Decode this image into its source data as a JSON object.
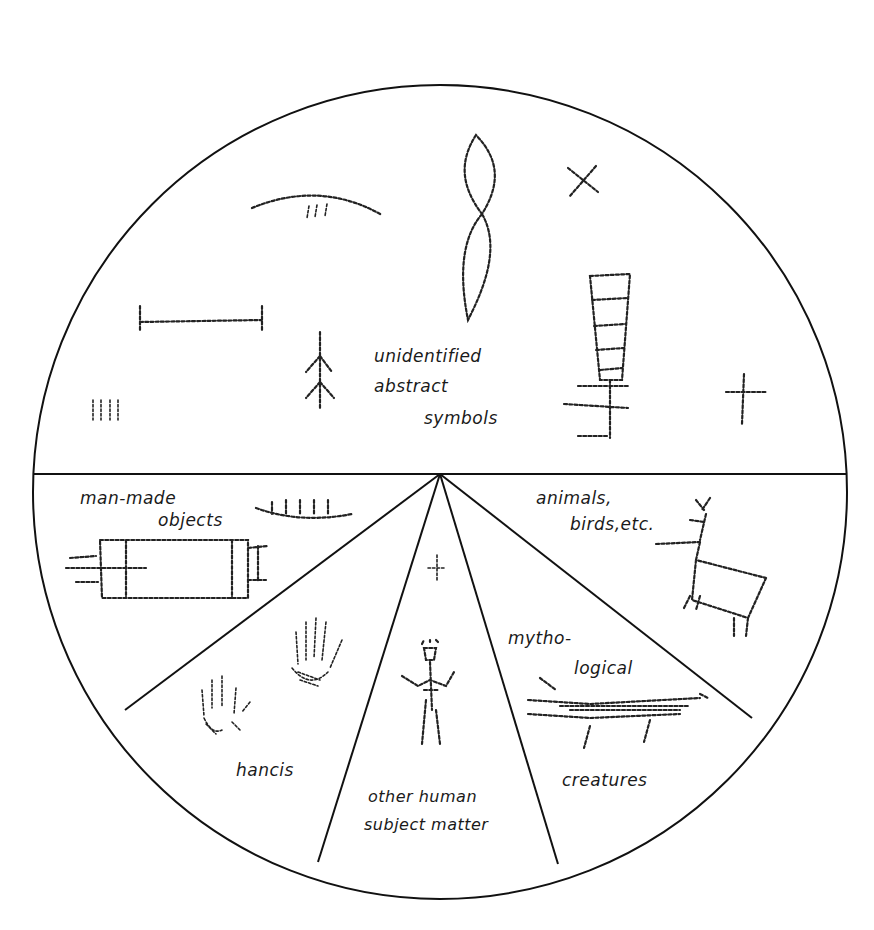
{
  "diagram": {
    "type": "sectioned-circle",
    "line_color": "#111111",
    "background": "#ffffff",
    "sections": [
      {
        "id": "abstract",
        "label_lines": [
          "unidentified",
          "abstract",
          "symbols"
        ],
        "sketches": [
          "arc-with-three-marks",
          "double-lozenge-vertical",
          "x-mark",
          "horizontal-bar-with-ends",
          "branch-tree-figure",
          "four-vertical-strokes",
          "ladder-cross-figure",
          "small-cross"
        ]
      },
      {
        "id": "objects",
        "label_lines": [
          "man-made",
          "objects"
        ],
        "sketches": [
          "boat-with-crew",
          "rectangular-object"
        ]
      },
      {
        "id": "hands",
        "label_lines": [
          "hancis"
        ],
        "sketches": [
          "left-handprint",
          "right-handprint"
        ]
      },
      {
        "id": "human",
        "label_lines": [
          "other human",
          "subject matter"
        ],
        "sketches": [
          "small-figure",
          "standing-human-figure"
        ]
      },
      {
        "id": "mythological",
        "label_lines": [
          "mytho-",
          "logical",
          "creatures"
        ],
        "sketches": [
          "serpent-creature"
        ]
      },
      {
        "id": "animals",
        "label_lines": [
          "animals,",
          "birds,etc."
        ],
        "sketches": [
          "antlered-deer"
        ]
      }
    ]
  }
}
